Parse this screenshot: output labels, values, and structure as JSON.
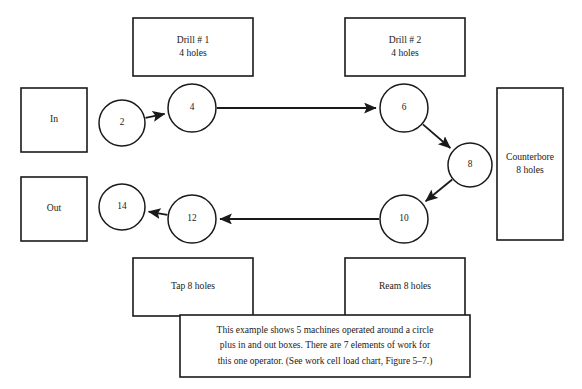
{
  "diagram": {
    "type": "work-cell-flow-diagram",
    "canvas": {
      "width": 582,
      "height": 389,
      "background": "#ffffff"
    },
    "stroke_color": "#1a1a1a",
    "machine_boxes": [
      {
        "id": "drill-1",
        "line1": "Drill # 1",
        "line2": "4 holes",
        "x": 133,
        "y": 18,
        "w": 120,
        "h": 58
      },
      {
        "id": "drill-2",
        "line1": "Drill # 2",
        "line2": "4 holes",
        "x": 345,
        "y": 18,
        "w": 120,
        "h": 58
      },
      {
        "id": "counterbore",
        "line1": "Counterbore",
        "line2": "8 holes",
        "x": 497,
        "y": 88,
        "w": 66,
        "h": 152
      },
      {
        "id": "ream",
        "line1": "Ream 8 holes",
        "line2": "",
        "x": 345,
        "y": 258,
        "w": 120,
        "h": 58
      },
      {
        "id": "tap",
        "line1": "Tap 8 holes",
        "line2": "",
        "x": 133,
        "y": 258,
        "w": 120,
        "h": 58
      }
    ],
    "io_boxes": [
      {
        "id": "in",
        "label": "In",
        "x": 21,
        "y": 88,
        "w": 66,
        "h": 64
      },
      {
        "id": "out",
        "label": "Out",
        "x": 21,
        "y": 177,
        "w": 66,
        "h": 64
      }
    ],
    "nodes": [
      {
        "id": "n2",
        "label": "2",
        "cx": 122,
        "cy": 123,
        "r": 23
      },
      {
        "id": "n4",
        "label": "4",
        "cx": 192,
        "cy": 108,
        "r": 24
      },
      {
        "id": "n6",
        "label": "6",
        "cx": 404,
        "cy": 108,
        "r": 24
      },
      {
        "id": "n8",
        "label": "8",
        "cx": 470,
        "cy": 165,
        "r": 22
      },
      {
        "id": "n10",
        "label": "10",
        "cx": 404,
        "cy": 219,
        "r": 24
      },
      {
        "id": "n12",
        "label": "12",
        "cx": 192,
        "cy": 219,
        "r": 24
      },
      {
        "id": "n14",
        "label": "14",
        "cx": 122,
        "cy": 207,
        "r": 23
      }
    ],
    "arrows": [
      {
        "id": "a-2-4",
        "from": "n2",
        "to": "n4"
      },
      {
        "id": "a-4-6",
        "from": "n4",
        "to": "n6"
      },
      {
        "id": "a-6-8",
        "from": "n6",
        "to": "n8"
      },
      {
        "id": "a-8-10",
        "from": "n8",
        "to": "n10"
      },
      {
        "id": "a-10-12",
        "from": "n10",
        "to": "n12"
      },
      {
        "id": "a-12-14",
        "from": "n12",
        "to": "n14"
      }
    ],
    "caption": {
      "x": 180,
      "y": 315,
      "w": 290,
      "h": 62,
      "line1": "This example shows 5 machines operated around a circle",
      "line2": "plus in and out boxes. There are 7 elements of work for",
      "line3": "this one operator. (See work cell load chart, Figure 5–7.)"
    }
  }
}
